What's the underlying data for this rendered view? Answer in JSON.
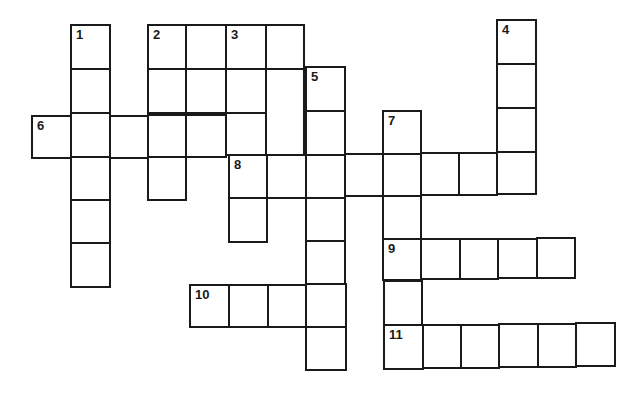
{
  "puzzle": {
    "type": "crossword",
    "cell_w": 40,
    "cell_h": 44,
    "cells": [
      {
        "x": 70,
        "y": 24,
        "w": 41,
        "h": 46,
        "n": "1"
      },
      {
        "x": 70,
        "y": 68,
        "w": 41,
        "h": 46
      },
      {
        "x": 70,
        "y": 112,
        "w": 41,
        "h": 46
      },
      {
        "x": 70,
        "y": 156,
        "w": 41,
        "h": 45
      },
      {
        "x": 70,
        "y": 199,
        "w": 41,
        "h": 45
      },
      {
        "x": 70,
        "y": 242,
        "w": 41,
        "h": 46
      },
      {
        "x": 147,
        "y": 24,
        "w": 40,
        "h": 46,
        "n": "2"
      },
      {
        "x": 185,
        "y": 24,
        "w": 42,
        "h": 46
      },
      {
        "x": 225,
        "y": 24,
        "w": 42,
        "h": 46,
        "n": "3"
      },
      {
        "x": 265,
        "y": 24,
        "w": 40,
        "h": 46
      },
      {
        "x": 147,
        "y": 68,
        "w": 40,
        "h": 46
      },
      {
        "x": 185,
        "y": 68,
        "w": 42,
        "h": 46
      },
      {
        "x": 225,
        "y": 68,
        "w": 42,
        "h": 46
      },
      {
        "x": 265,
        "y": 68,
        "w": 40,
        "h": 88
      },
      {
        "x": 305,
        "y": 66,
        "w": 41,
        "h": 46,
        "n": "5"
      },
      {
        "x": 31,
        "y": 115,
        "w": 41,
        "h": 44,
        "n": "6"
      },
      {
        "x": 109,
        "y": 115,
        "w": 40,
        "h": 44
      },
      {
        "x": 147,
        "y": 114,
        "w": 40,
        "h": 44
      },
      {
        "x": 185,
        "y": 114,
        "w": 42,
        "h": 44
      },
      {
        "x": 225,
        "y": 112,
        "w": 42,
        "h": 44
      },
      {
        "x": 305,
        "y": 110,
        "w": 41,
        "h": 46
      },
      {
        "x": 147,
        "y": 156,
        "w": 40,
        "h": 45
      },
      {
        "x": 228,
        "y": 154,
        "w": 40,
        "h": 45,
        "n": "8"
      },
      {
        "x": 266,
        "y": 154,
        "w": 41,
        "h": 45
      },
      {
        "x": 305,
        "y": 154,
        "w": 41,
        "h": 45
      },
      {
        "x": 344,
        "y": 153,
        "w": 40,
        "h": 44
      },
      {
        "x": 382,
        "y": 110,
        "w": 40,
        "h": 45,
        "n": "7"
      },
      {
        "x": 382,
        "y": 153,
        "w": 40,
        "h": 44
      },
      {
        "x": 420,
        "y": 152,
        "w": 40,
        "h": 44
      },
      {
        "x": 458,
        "y": 152,
        "w": 40,
        "h": 44
      },
      {
        "x": 496,
        "y": 19,
        "w": 41,
        "h": 46,
        "n": "4"
      },
      {
        "x": 496,
        "y": 63,
        "w": 41,
        "h": 46
      },
      {
        "x": 496,
        "y": 107,
        "w": 41,
        "h": 46
      },
      {
        "x": 496,
        "y": 151,
        "w": 41,
        "h": 44
      },
      {
        "x": 228,
        "y": 197,
        "w": 40,
        "h": 46
      },
      {
        "x": 305,
        "y": 197,
        "w": 41,
        "h": 45
      },
      {
        "x": 382,
        "y": 195,
        "w": 40,
        "h": 45
      },
      {
        "x": 305,
        "y": 240,
        "w": 41,
        "h": 45
      },
      {
        "x": 382,
        "y": 238,
        "w": 40,
        "h": 43,
        "n": "9"
      },
      {
        "x": 420,
        "y": 238,
        "w": 41,
        "h": 42
      },
      {
        "x": 459,
        "y": 238,
        "w": 40,
        "h": 42
      },
      {
        "x": 497,
        "y": 238,
        "w": 41,
        "h": 41
      },
      {
        "x": 536,
        "y": 237,
        "w": 40,
        "h": 42
      },
      {
        "x": 189,
        "y": 284,
        "w": 41,
        "h": 44,
        "n": "10"
      },
      {
        "x": 228,
        "y": 284,
        "w": 41,
        "h": 44
      },
      {
        "x": 267,
        "y": 284,
        "w": 40,
        "h": 44
      },
      {
        "x": 305,
        "y": 283,
        "w": 42,
        "h": 45
      },
      {
        "x": 305,
        "y": 326,
        "w": 42,
        "h": 45
      },
      {
        "x": 383,
        "y": 280,
        "w": 40,
        "h": 46
      },
      {
        "x": 383,
        "y": 324,
        "w": 41,
        "h": 46,
        "n": "11"
      },
      {
        "x": 422,
        "y": 324,
        "w": 40,
        "h": 45
      },
      {
        "x": 460,
        "y": 324,
        "w": 40,
        "h": 45
      },
      {
        "x": 498,
        "y": 323,
        "w": 41,
        "h": 45
      },
      {
        "x": 537,
        "y": 323,
        "w": 40,
        "h": 45
      },
      {
        "x": 575,
        "y": 322,
        "w": 41,
        "h": 45
      }
    ]
  },
  "clue_numbers": [
    "1",
    "2",
    "3",
    "4",
    "5",
    "6",
    "7",
    "8",
    "9",
    "10",
    "11"
  ]
}
